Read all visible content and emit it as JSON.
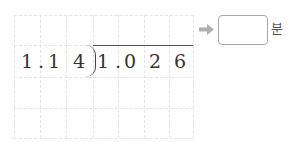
{
  "problem": {
    "divisor": [
      "1",
      ".",
      "1",
      "4"
    ],
    "dividend": [
      "1",
      ".",
      "0",
      "2",
      "6"
    ],
    "divisor_text": "1.14",
    "dividend_text": "1.026"
  },
  "answer": {
    "value": "",
    "unit": "분"
  },
  "icons": {
    "arrow": "right-arrow-icon"
  },
  "colors": {
    "grid_line": "#e3e3e3",
    "text": "#333333",
    "arrow": "#b0b0b0",
    "box_border": "#a8a8a8"
  }
}
